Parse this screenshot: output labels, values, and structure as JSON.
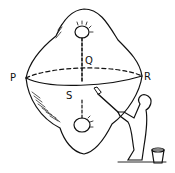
{
  "diagram": {
    "labels": {
      "p": "P",
      "q": "Q",
      "r": "R",
      "s": "S"
    },
    "colors": {
      "ink": "#111111",
      "background": "#ffffff"
    }
  }
}
